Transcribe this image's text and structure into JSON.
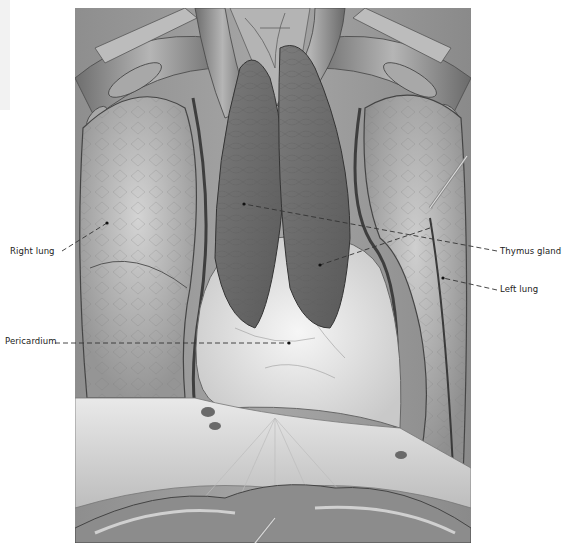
{
  "figure": {
    "colors": {
      "background": "#ffffff",
      "illustration_base": "#9a9a9a",
      "lung": "#b8b8b8",
      "thymus": "#6f6f6f",
      "pericardium": "#e6e6e6",
      "leader_line": "#333333",
      "label_text": "#222222"
    }
  },
  "labels": [
    {
      "id": "right-lung",
      "text": "Right lung",
      "x": 10,
      "y": 248,
      "anchor": {
        "x": 107,
        "y": 223
      },
      "line_start": {
        "x": 62,
        "y": 251
      }
    },
    {
      "id": "pericardium",
      "text": "Pericardium",
      "x": 5,
      "y": 338,
      "anchor": {
        "x": 289,
        "y": 343
      },
      "line_start": {
        "x": 55,
        "y": 343
      }
    },
    {
      "id": "thymus-gland",
      "text": "Thymus gland",
      "x": 500,
      "y": 246,
      "anchor": {
        "x": 244,
        "y": 204
      },
      "line_start": {
        "x": 497,
        "y": 251
      },
      "anchor2": {
        "x": 320,
        "y": 265
      }
    },
    {
      "id": "left-lung",
      "text": "Left lung",
      "x": 500,
      "y": 284,
      "anchor": {
        "x": 443,
        "y": 278
      },
      "line_start": {
        "x": 497,
        "y": 290
      }
    }
  ]
}
